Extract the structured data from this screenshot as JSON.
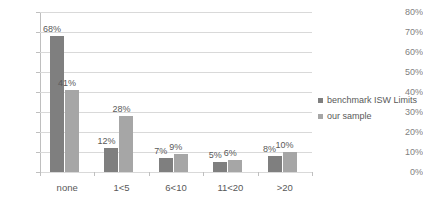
{
  "chart_data": {
    "type": "bar",
    "title": "",
    "subtitle": "",
    "xlabel": "",
    "ylabel": "",
    "categories": [
      "none",
      "1<5",
      "6<10",
      "11<20",
      ">20"
    ],
    "series": [
      {
        "name": "benchmark ISW Limits",
        "color": "#7f7f7f",
        "values": [
          68,
          12,
          7,
          5,
          8
        ],
        "labels": [
          "68%",
          "12%",
          "7%",
          "5%",
          "8%"
        ]
      },
      {
        "name": "our sample",
        "color": "#a6a6a6",
        "values": [
          41,
          28,
          9,
          6,
          10
        ],
        "labels": [
          "41%",
          "28%",
          "9%",
          "6%",
          "10%"
        ]
      }
    ],
    "ylim": [
      0,
      80
    ],
    "ytick_values": [
      0,
      10,
      20,
      30,
      40,
      50,
      60,
      70,
      80
    ],
    "ytick_labels": [
      "0%",
      "10%",
      "20%",
      "30%",
      "40%",
      "50%",
      "60%",
      "70%",
      "80%"
    ],
    "grid": true,
    "grid_axis": "y",
    "legend_position": "right",
    "value_labels": true,
    "axis_line_color": "#bfbfbf",
    "grid_color": "#d9d9d9",
    "text_color": "#595959",
    "background_color": "#ffffff"
  },
  "legend": {
    "items": [
      {
        "label": "benchmark ISW Limits",
        "color": "#7f7f7f"
      },
      {
        "label": "our sample",
        "color": "#a6a6a6"
      }
    ]
  }
}
